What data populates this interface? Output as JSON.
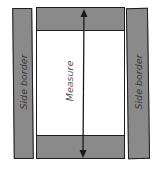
{
  "diagram": {
    "labels": {
      "left_column": "Side border",
      "right_column": "Side border",
      "center_arrow": "Measure"
    },
    "colors": {
      "fill": "#8a8a8a",
      "stroke": "#1e1e1e",
      "page": "#ffffff"
    }
  }
}
